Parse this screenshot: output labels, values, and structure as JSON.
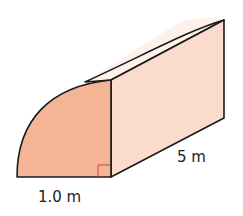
{
  "diagram": {
    "shape": "quarter-cylinder prism",
    "labels": {
      "radius": "1.0 m",
      "length": "5 m"
    },
    "colors": {
      "front_face": "#f4b596",
      "side_face": "#fbdccc",
      "top_face": "#fdf1ea",
      "outline": "#1a1a1a",
      "right_angle_marker": "#e0402a"
    }
  }
}
